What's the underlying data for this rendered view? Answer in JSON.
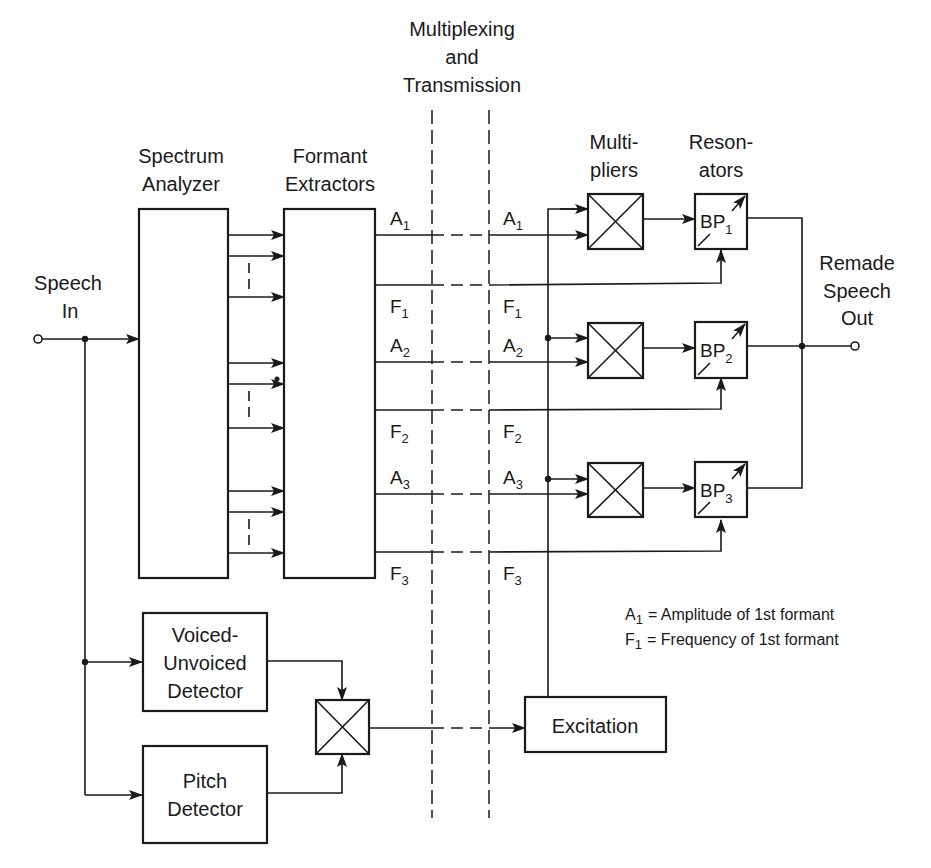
{
  "title": {
    "multiplexing": [
      "Multiplexing",
      "and",
      "Transmission"
    ]
  },
  "input": {
    "label": [
      "Speech",
      "In"
    ]
  },
  "output": {
    "label": [
      "Remade",
      "Speech",
      "Out"
    ]
  },
  "blocks": {
    "spectrum_analyzer": [
      "Spectrum",
      "Analyzer"
    ],
    "formant_extractors": [
      "Formant",
      "Extractors"
    ],
    "multipliers": [
      "Multi-",
      "pliers"
    ],
    "resonators": [
      "Reson-",
      "ators"
    ],
    "voiced_unvoiced": [
      "Voiced-",
      "Unvoiced",
      "Detector"
    ],
    "pitch_detector": [
      "Pitch",
      "Detector"
    ],
    "excitation": "Excitation"
  },
  "signals": [
    {
      "name": "A",
      "sub": "1"
    },
    {
      "name": "F",
      "sub": "1"
    },
    {
      "name": "A",
      "sub": "2"
    },
    {
      "name": "F",
      "sub": "2"
    },
    {
      "name": "A",
      "sub": "3"
    },
    {
      "name": "F",
      "sub": "3"
    }
  ],
  "resonator_labels": [
    {
      "name": "BP",
      "sub": "1"
    },
    {
      "name": "BP",
      "sub": "2"
    },
    {
      "name": "BP",
      "sub": "3"
    }
  ],
  "legend": [
    {
      "sym": "A",
      "sub": "1",
      "text": "= Amplitude of 1st formant"
    },
    {
      "sym": "F",
      "sub": "1",
      "text": "= Frequency of 1st formant"
    }
  ],
  "colors": {
    "ink": "#1a1a1a",
    "background": "#ffffff"
  }
}
